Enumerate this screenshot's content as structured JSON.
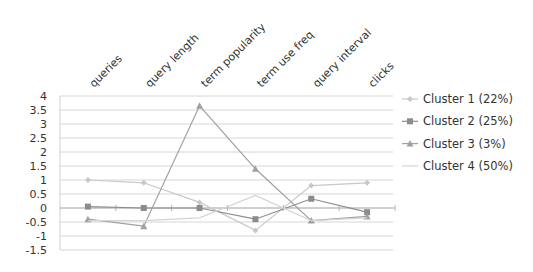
{
  "chart_data": {
    "type": "line",
    "title": "",
    "xlabel": "",
    "ylabel": "",
    "categories": [
      "queries",
      "query length",
      "term popularity",
      "term use freq",
      "query interval",
      "clicks"
    ],
    "series": [
      {
        "name": "Cluster 1 (22%)",
        "values": [
          1.0,
          0.9,
          0.2,
          -0.8,
          0.8,
          0.9
        ],
        "color": "#c8c8c8",
        "marker": "diamond"
      },
      {
        "name": "Cluster 2 (25%)",
        "values": [
          0.05,
          0.0,
          0.0,
          -0.4,
          0.33,
          -0.15
        ],
        "color": "#8c8c8c",
        "marker": "square"
      },
      {
        "name": "Cluster 3 (3%)",
        "values": [
          -0.4,
          -0.65,
          3.65,
          1.4,
          -0.45,
          -0.3
        ],
        "color": "#a0a0a0",
        "marker": "triangle"
      },
      {
        "name": "Cluster 4 (50%)",
        "values": [
          -0.45,
          -0.45,
          -0.35,
          0.45,
          -0.45,
          -0.35
        ],
        "color": "#d4d4d4",
        "marker": "none"
      }
    ],
    "ylim": [
      -1.5,
      4
    ],
    "yticks": [
      "4",
      "3.5",
      "3",
      "2.5",
      "2",
      "1.5",
      "1",
      "0.5",
      "0",
      "-0.5",
      "-1",
      "-1.5"
    ],
    "grid": true,
    "legend_position": "right"
  }
}
